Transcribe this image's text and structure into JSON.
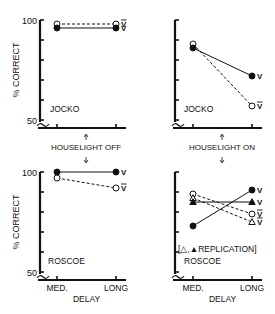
{
  "figure": {
    "ylabel": "% CORRECT",
    "xlabel": "DELAY",
    "x_ticks": [
      "MED.",
      "LONG"
    ],
    "y_ticks": [
      "100",
      "50"
    ],
    "divider_label_off": "HOUSELIGHT OFF",
    "divider_label_on": "HOUSELIGHT ON",
    "replication_note": "[△,▲REPLICATION]"
  },
  "chart_data": [
    {
      "type": "line",
      "panel": "top-left",
      "subject": "JOCKO",
      "condition": "HOUSELIGHT OFF",
      "categories": [
        "MED.",
        "LONG"
      ],
      "xlabel": "",
      "ylabel": "% CORRECT",
      "ylim": [
        50,
        100
      ],
      "series": [
        {
          "name": "V̅",
          "marker": "open-circle",
          "line": "dashed",
          "values": [
            98,
            98
          ]
        },
        {
          "name": "V",
          "marker": "filled-circle",
          "line": "solid",
          "values": [
            96,
            96
          ]
        }
      ]
    },
    {
      "type": "line",
      "panel": "top-right",
      "subject": "JOCKO",
      "condition": "HOUSELIGHT ON",
      "categories": [
        "MED.",
        "LONG"
      ],
      "xlabel": "",
      "ylabel": "",
      "ylim": [
        50,
        100
      ],
      "series": [
        {
          "name": "V̅",
          "marker": "open-circle",
          "line": "dashed",
          "values": [
            88,
            57
          ]
        },
        {
          "name": "V",
          "marker": "filled-circle",
          "line": "solid",
          "values": [
            86,
            72
          ]
        }
      ]
    },
    {
      "type": "line",
      "panel": "bottom-left",
      "subject": "ROSCOE",
      "condition": "HOUSELIGHT OFF",
      "categories": [
        "MED.",
        "LONG"
      ],
      "xlabel": "DELAY",
      "ylabel": "% CORRECT",
      "ylim": [
        50,
        100
      ],
      "series": [
        {
          "name": "V",
          "marker": "filled-circle",
          "line": "solid",
          "values": [
            100,
            100
          ]
        },
        {
          "name": "V̅",
          "marker": "open-circle",
          "line": "dashed",
          "values": [
            97,
            92
          ]
        }
      ]
    },
    {
      "type": "line",
      "panel": "bottom-right",
      "subject": "ROSCOE",
      "condition": "HOUSELIGHT ON",
      "annotation": "[△,▲REPLICATION]",
      "categories": [
        "MED.",
        "LONG"
      ],
      "xlabel": "DELAY",
      "ylabel": "",
      "ylim": [
        50,
        100
      ],
      "series": [
        {
          "name": "V̅",
          "marker": "open-circle",
          "line": "dashed",
          "values": [
            89,
            79
          ]
        },
        {
          "name": "V̅ (replication)",
          "marker": "open-triangle",
          "line": "dashed",
          "values": [
            87,
            75
          ]
        },
        {
          "name": "V (replication)",
          "marker": "filled-triangle",
          "line": "solid",
          "values": [
            85,
            85
          ]
        },
        {
          "name": "V",
          "marker": "filled-circle",
          "line": "solid",
          "values": [
            73,
            91
          ]
        }
      ]
    }
  ]
}
